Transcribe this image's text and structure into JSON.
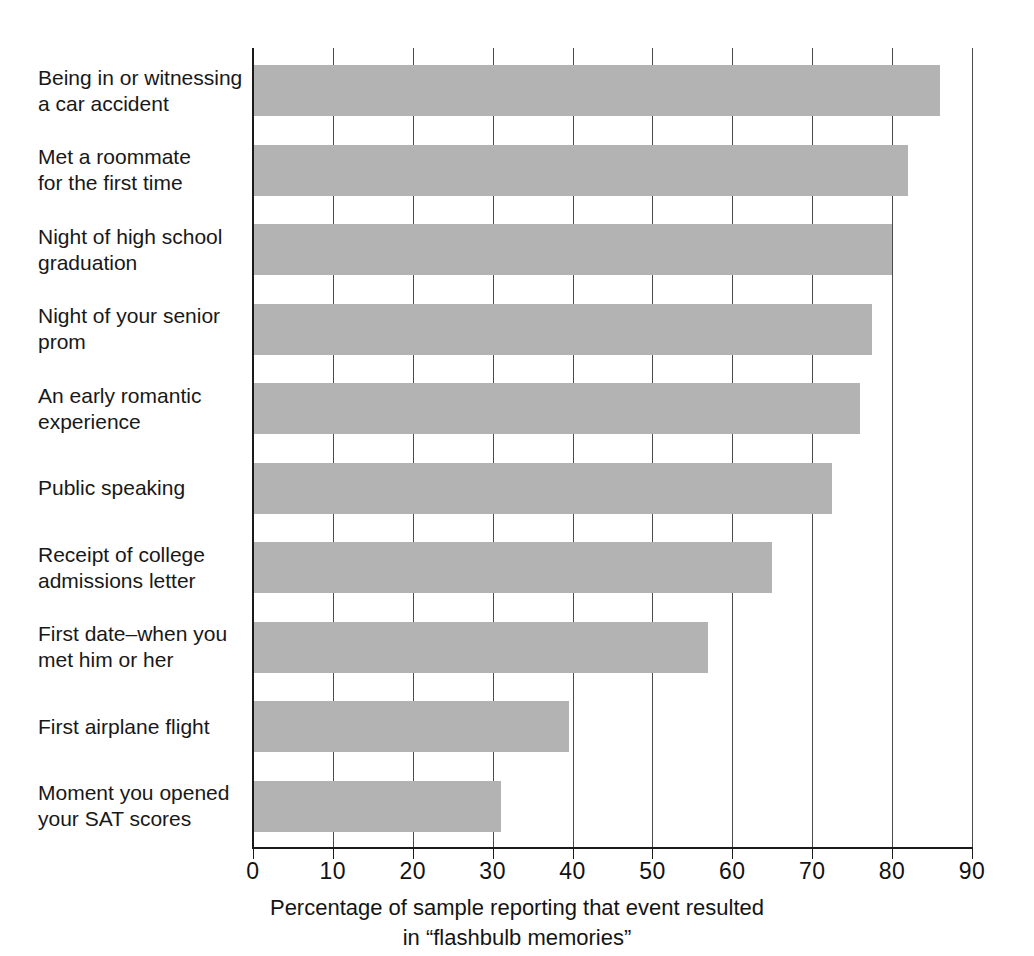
{
  "chart_data": {
    "type": "bar",
    "orientation": "horizontal",
    "title": "",
    "subtitle": "",
    "xlabel": "Percentage of sample reporting that event resulted\nin “flashbulb memories”",
    "ylabel": "",
    "xlim": [
      0,
      90
    ],
    "xticks": [
      0,
      10,
      20,
      30,
      40,
      50,
      60,
      70,
      80,
      90
    ],
    "xtick_labels": [
      "0",
      "10",
      "20",
      "30",
      "40",
      "50",
      "60",
      "70",
      "80",
      "90"
    ],
    "grid": "vertical",
    "legend": "none",
    "bar_color": "#b3b3b3",
    "axis_color": "#1a1a1a",
    "categories": [
      "Being in or witnessing\na car accident",
      "Met a roommate\nfor the first time",
      "Night of high school\ngraduation",
      "Night of your senior\nprom",
      "An early romantic\nexperience",
      "Public speaking",
      "Receipt of college\nadmissions letter",
      "First date–when you\nmet him or her",
      "First airplane flight",
      "Moment you opened\nyour SAT scores"
    ],
    "values": [
      86,
      82,
      80,
      77.5,
      76,
      72.5,
      65,
      57,
      39.5,
      31
    ]
  },
  "axis": {
    "x_title_line1": "Percentage of sample reporting that event resulted",
    "x_title_line2": "in “flashbulb memories”"
  }
}
